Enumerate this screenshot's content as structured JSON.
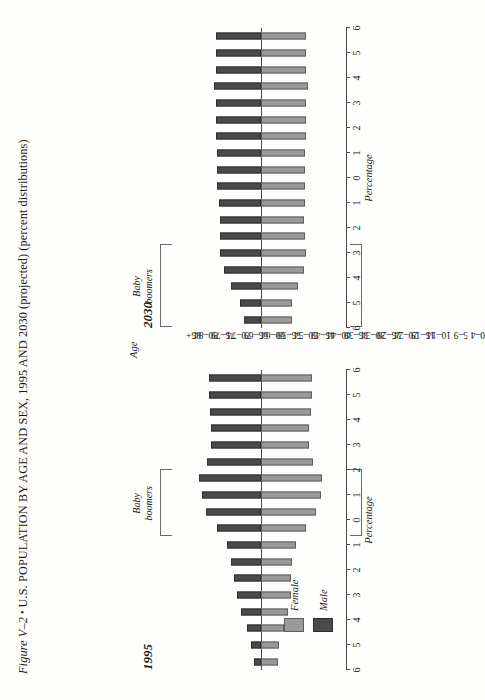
{
  "figure": {
    "label": "Figure V–2",
    "bullet": "•",
    "title": "U.S. POPULATION BY AGE AND SEX, 1995 AND 2030 (projected) (percent distributions)"
  },
  "legend": {
    "female_label": "Female",
    "male_label": "Male",
    "female_color": "#9a9a9a",
    "male_color": "#4a4a4a"
  },
  "axis": {
    "age_axis_title": "Age",
    "percentage_axis_title": "Percentage",
    "percentage_ticks": [
      "6",
      "5",
      "4",
      "3",
      "2",
      "1",
      "0",
      "1",
      "2",
      "3",
      "4",
      "5",
      "6"
    ]
  },
  "annotations": {
    "baby_boomers_line1": "Baby",
    "baby_boomers_line2": "boomers"
  },
  "panels": [
    {
      "year": "1995"
    },
    {
      "year": "2030"
    }
  ],
  "chart_data": {
    "type": "bar",
    "title": "U.S. POPULATION BY AGE AND SEX, 1995 AND 2030 (projected) (percent distributions)",
    "xlabel": "Age",
    "ylabel": "Percentage",
    "ylim": [
      0,
      6
    ],
    "grid": false,
    "legend_position": "bottom-left",
    "categories": [
      "85+",
      "80–84",
      "75–79",
      "70–74",
      "65–69",
      "60–64",
      "55–59",
      "50–54",
      "45–49",
      "40–44",
      "35–39",
      "30–34",
      "25–29",
      "20–24",
      "15–19",
      "10–14",
      "5–9",
      "0–4"
    ],
    "panels": [
      {
        "name": "1995",
        "baby_boomers_range": [
          "45–49",
          "30–34"
        ],
        "series": [
          {
            "name": "Male",
            "values": [
              0.5,
              0.7,
              1.0,
              1.4,
              1.7,
              1.9,
              2.1,
              2.4,
              3.1,
              3.9,
              4.2,
              4.4,
              3.8,
              3.5,
              3.5,
              3.6,
              3.7,
              3.7
            ]
          },
          {
            "name": "Female",
            "values": [
              1.2,
              1.3,
              1.6,
              1.9,
              2.1,
              2.1,
              2.2,
              2.5,
              3.2,
              3.9,
              4.2,
              4.3,
              3.7,
              3.4,
              3.4,
              3.5,
              3.6,
              3.6
            ]
          }
        ]
      },
      {
        "name": "2030",
        "baby_boomers_range": [
          "85+",
          "65–69"
        ],
        "series": [
          {
            "name": "Male",
            "values": [
              1.2,
              1.5,
              2.1,
              2.6,
              2.9,
              2.9,
              2.9,
              3.0,
              3.1,
              3.1,
              3.1,
              3.2,
              3.2,
              3.2,
              3.3,
              3.2,
              3.2,
              3.2
            ]
          },
          {
            "name": "Female",
            "values": [
              2.2,
              2.2,
              2.6,
              3.0,
              3.2,
              3.1,
              3.0,
              3.1,
              3.1,
              3.1,
              3.1,
              3.2,
              3.2,
              3.2,
              3.3,
              3.2,
              3.2,
              3.2
            ]
          }
        ]
      }
    ]
  }
}
